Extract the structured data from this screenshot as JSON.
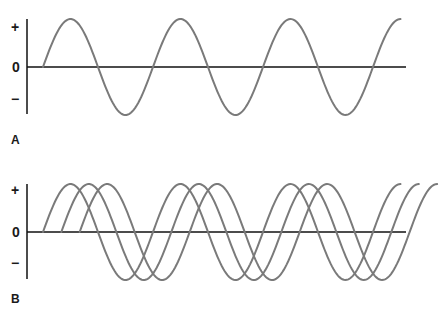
{
  "figure": {
    "type": "sine-wave-diagram",
    "wave_color": "#7a7a7a",
    "axis_color": "#111111",
    "panels": [
      {
        "id": "A",
        "label": "A",
        "y_labels": {
          "plus": "+",
          "zero": "0",
          "minus": "−"
        },
        "waves": [
          {
            "name": "wave-1",
            "phase_offset_deg": 0,
            "cycles": 3.25
          }
        ]
      },
      {
        "id": "B",
        "label": "B",
        "y_labels": {
          "plus": "+",
          "zero": "0",
          "minus": "−"
        },
        "waves": [
          {
            "name": "wave-1",
            "phase_offset_deg": 0,
            "cycles": 3.25
          },
          {
            "name": "wave-2",
            "phase_offset_deg": 60,
            "cycles": 3.25
          },
          {
            "name": "wave-3",
            "phase_offset_deg": 120,
            "cycles": 3.25
          }
        ]
      }
    ]
  }
}
